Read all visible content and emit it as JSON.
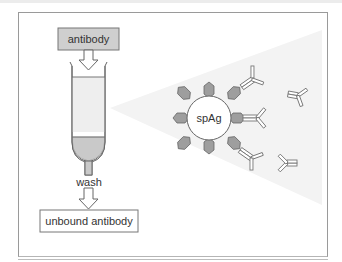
{
  "diagram": {
    "input_label": "antibody",
    "wash_label": "wash",
    "output_label": "unbound antibody",
    "bead_label": "spAg"
  },
  "colors": {
    "frame": "#9a9a9a",
    "box_fill": "#cfcfcf",
    "column_fill": "#eeeeee",
    "column_liquid": "#c9c9c9",
    "antigen_fill": "#9e9e9e",
    "cone_fill": "#f3f3f3"
  }
}
